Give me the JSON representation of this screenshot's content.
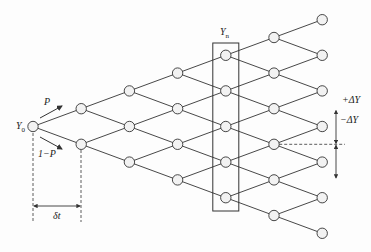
{
  "diagram": {
    "type": "binomial-tree",
    "steps": 6,
    "start_node_label": "Y",
    "start_node_sub": "0",
    "highlight_column_label": "Y",
    "highlight_column_sub": "n",
    "highlight_column_index": 4,
    "up_prob_label": "P",
    "down_prob_label": "1−P",
    "time_step_label": "δt",
    "up_move_label": "+ΔY",
    "down_move_label": "−ΔY",
    "colors": {
      "line": "#333333",
      "node_fill": "#f2f2f2",
      "background": "#fdfdfd"
    }
  }
}
